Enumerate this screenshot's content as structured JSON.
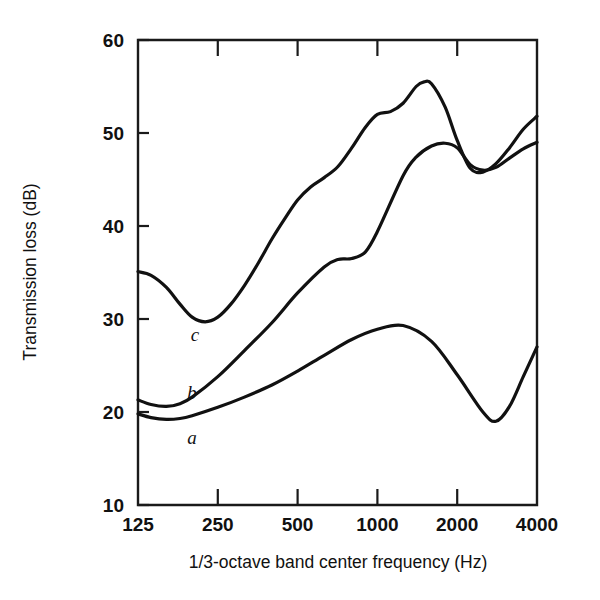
{
  "chart_data": {
    "type": "line",
    "title": "",
    "xlabel": "1/3-octave band center frequency (Hz)",
    "ylabel": "Transmission loss (dB)",
    "xscale": "log",
    "yscale": "linear",
    "xlim": [
      125,
      4000
    ],
    "ylim": [
      10,
      60
    ],
    "xticks": [
      125,
      250,
      500,
      1000,
      2000,
      4000
    ],
    "xtick_labels": [
      "125",
      "250",
      "500",
      "1000",
      "2000",
      "4000"
    ],
    "yticks": [
      10,
      20,
      30,
      40,
      50,
      60
    ],
    "ytick_labels": [
      "10",
      "20",
      "30",
      "40",
      "50",
      "60"
    ],
    "grid": false,
    "legend": "inline-curve-labels",
    "series": [
      {
        "name": "a",
        "label": "a",
        "label_x": 200,
        "label_y": 16.6,
        "x": [
          125,
          140,
          160,
          180,
          200,
          250,
          315,
          400,
          500,
          630,
          800,
          1000,
          1250,
          1600,
          2000,
          2500,
          2800,
          3150,
          3550,
          4000
        ],
        "y": [
          19.8,
          19.4,
          19.2,
          19.3,
          19.6,
          20.5,
          21.6,
          22.9,
          24.4,
          26.1,
          27.8,
          28.9,
          29.3,
          27.6,
          24.0,
          20.0,
          19.0,
          20.6,
          23.8,
          27.0
        ]
      },
      {
        "name": "b",
        "label": "b",
        "label_x": 200,
        "label_y": 21.4,
        "x": [
          125,
          140,
          160,
          180,
          200,
          250,
          315,
          400,
          500,
          630,
          710,
          800,
          900,
          1000,
          1250,
          1400,
          1600,
          1800,
          2000,
          2240,
          2500,
          2800,
          3150,
          3550,
          4000
        ],
        "y": [
          21.3,
          20.8,
          20.6,
          20.9,
          21.6,
          23.8,
          26.6,
          29.6,
          32.8,
          35.6,
          36.4,
          36.5,
          37.2,
          39.4,
          45.4,
          47.4,
          48.6,
          48.9,
          48.4,
          46.6,
          46.0,
          46.3,
          47.3,
          48.3,
          49.0
        ]
      },
      {
        "name": "c",
        "label": "c",
        "label_x": 205,
        "label_y": 27.6,
        "x": [
          125,
          140,
          160,
          180,
          200,
          224,
          250,
          280,
          315,
          355,
          400,
          450,
          500,
          560,
          630,
          710,
          800,
          900,
          1000,
          1120,
          1250,
          1400,
          1500,
          1600,
          1800,
          2000,
          2240,
          2500,
          2800,
          3150,
          3550,
          4000
        ],
        "y": [
          35.1,
          34.7,
          33.4,
          31.6,
          30.2,
          29.7,
          30.2,
          31.6,
          33.6,
          36.0,
          38.6,
          40.9,
          42.8,
          44.2,
          45.2,
          46.4,
          48.4,
          50.6,
          52.0,
          52.3,
          53.2,
          55.0,
          55.5,
          55.3,
          52.8,
          49.2,
          46.2,
          45.8,
          46.7,
          48.4,
          50.4,
          51.8
        ]
      }
    ]
  },
  "axes": {
    "y_title": "Transmission loss (dB)",
    "x_title": "1/3-octave band center frequency (Hz)"
  },
  "colors": {
    "line": "#111111",
    "axis": "#1a1a1a",
    "background": "#ffffff"
  }
}
